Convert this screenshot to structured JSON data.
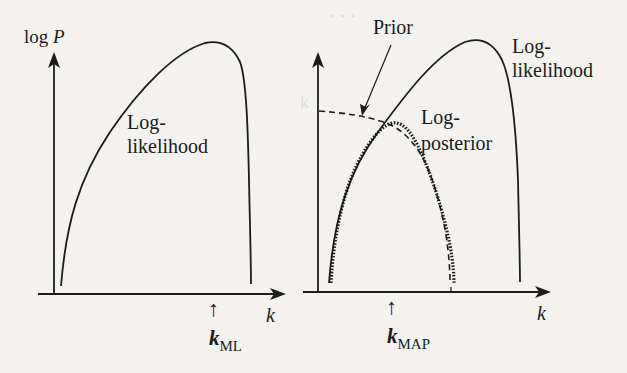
{
  "figure": {
    "left_panel": {
      "y_axis_label_prefix": "log ",
      "y_axis_label_var": "P",
      "x_axis_label": "k",
      "curve_label_line1": "Log-",
      "curve_label_line2": "likelihood",
      "marker_arrow": "↑",
      "marker_symbol": "k",
      "marker_subscript": "ML"
    },
    "right_panel": {
      "x_axis_label": "k",
      "prior_label": "Prior",
      "likelihood_label_line1": "Log-",
      "likelihood_label_line2": "likelihood",
      "posterior_label_line1": "Log-",
      "posterior_label_line2": "posterior",
      "marker_arrow": "↑",
      "marker_symbol": "k",
      "marker_subscript": "MAP"
    },
    "colors": {
      "ink": "#1c1c1c",
      "paper": "#f3f2ef",
      "bleed_through": "#d9d8d4"
    },
    "background_bleed_text": [
      "... the ... point can ... ... ... ... ... Ou",
      "... ... the ... ... ... ... ... ... ... ... (ean",
      "... ... ... ... ... ... ... ... ... ... ... uti",
      "... ... ... ... ... ... first model ... ... ...",
      "... ... ... ... ... ... ... ... ... ... ..."
    ]
  }
}
